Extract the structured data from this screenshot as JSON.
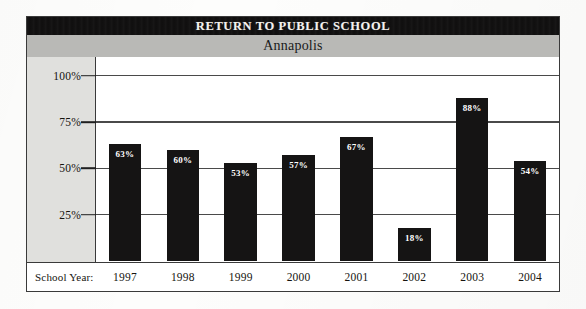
{
  "figure": {
    "title": "RETURN TO PUBLIC SCHOOL",
    "subtitle": "Annapolis",
    "axis_row_label": "School Year:",
    "colors": {
      "title_band": "#100f0f",
      "title_text": "#f4f2ee",
      "subtitle_band": "#b9b9b6",
      "axis_panel": "#e0e0dd",
      "bar": "#151414",
      "bar_label": "#ffffff",
      "frame": "#3a3a3a",
      "gridline": "#4a4a4a",
      "plot_background": "#ffffff"
    }
  },
  "chart_data": {
    "type": "bar",
    "title": "RETURN TO PUBLIC SCHOOL",
    "subtitle": "Annapolis",
    "xlabel": "School Year:",
    "ylabel": "",
    "categories": [
      "1997",
      "1998",
      "1999",
      "2000",
      "2001",
      "2002",
      "2003",
      "2004"
    ],
    "values": [
      63,
      60,
      53,
      57,
      67,
      18,
      88,
      54
    ],
    "value_labels": [
      "63%",
      "60%",
      "53%",
      "57%",
      "67%",
      "18%",
      "88%",
      "54%"
    ],
    "ylim": [
      0,
      110
    ],
    "yticks": [
      25,
      50,
      75,
      100
    ],
    "ytick_labels": [
      "25%",
      "50%",
      "75%",
      "100%"
    ],
    "grid": true,
    "grid_axis": "y",
    "legend": false,
    "legend_position": "none",
    "units": "percent"
  }
}
